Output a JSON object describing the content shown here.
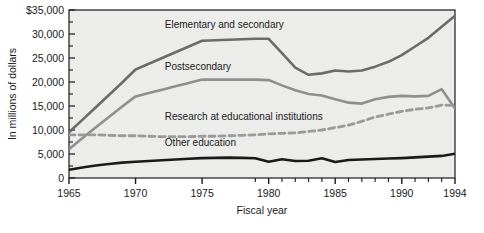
{
  "chart_data": {
    "type": "line",
    "title": "",
    "xlabel": "Fiscal year",
    "ylabel": "In millions of dollars",
    "xlim": [
      1965,
      1994
    ],
    "ylim": [
      0,
      35000
    ],
    "grid": false,
    "legend_position": "inline-labels",
    "background": "#ececea",
    "x_major_ticks": [
      1965,
      1970,
      1975,
      1980,
      1985,
      1990,
      1994
    ],
    "x_tick_labels": [
      "1965",
      "1970",
      "1975",
      "1980",
      "1985",
      "1990",
      "1994"
    ],
    "x_minor_ticks": [
      1966,
      1967,
      1968,
      1969,
      1971,
      1972,
      1973,
      1974,
      1976,
      1977,
      1978,
      1979,
      1981,
      1982,
      1983,
      1984,
      1986,
      1987,
      1988,
      1989,
      1991,
      1992,
      1993
    ],
    "y_ticks": [
      0,
      5000,
      10000,
      15000,
      20000,
      25000,
      30000,
      35000
    ],
    "y_tick_labels": [
      "0",
      "5,000",
      "10,000",
      "15,000",
      "20,000",
      "25,000",
      "30,000",
      "$35,000"
    ],
    "x": [
      1965,
      1966,
      1967,
      1968,
      1969,
      1970,
      1971,
      1972,
      1973,
      1974,
      1975,
      1976,
      1977,
      1978,
      1979,
      1980,
      1981,
      1982,
      1983,
      1984,
      1985,
      1986,
      1987,
      1988,
      1989,
      1990,
      1991,
      1992,
      1993,
      1994
    ],
    "series": [
      {
        "name": "Elementary and secondary",
        "label": "Elementary and secondary",
        "color": "#6b6b6b",
        "style": "solid",
        "width": 2.6,
        "values": [
          9500,
          12100,
          14700,
          17300,
          19900,
          22600,
          23800,
          25000,
          26200,
          27400,
          28600,
          28700,
          28800,
          28900,
          29000,
          29000,
          26000,
          23000,
          21500,
          21800,
          22400,
          22200,
          22400,
          23200,
          24200,
          25600,
          27400,
          29200,
          31500,
          33800
        ]
      },
      {
        "name": "Postsecondary",
        "label": "Postsecondary",
        "color": "#8f8f8f",
        "style": "solid",
        "width": 2.6,
        "values": [
          6000,
          8300,
          10500,
          12700,
          14900,
          17000,
          17700,
          18400,
          19100,
          19800,
          20500,
          20500,
          20500,
          20500,
          20500,
          20400,
          19300,
          18300,
          17500,
          17200,
          16400,
          15700,
          15500,
          16400,
          16900,
          17100,
          17000,
          17100,
          18500,
          14500
        ]
      },
      {
        "name": "Research at educational institutions",
        "label": "Research at educational institutions",
        "color": "#9a9a9a",
        "style": "dashed",
        "width": 2.8,
        "values": [
          9000,
          9000,
          9000,
          8900,
          8800,
          8800,
          8700,
          8600,
          8600,
          8600,
          8700,
          8700,
          8800,
          8900,
          9000,
          9200,
          9300,
          9400,
          9700,
          10000,
          10500,
          11000,
          11800,
          12700,
          13300,
          13900,
          14300,
          14600,
          15200,
          15100
        ]
      },
      {
        "name": "Other education",
        "label": "Other education",
        "color": "#1a1a1a",
        "style": "solid",
        "width": 2.6,
        "values": [
          1700,
          2200,
          2600,
          2900,
          3200,
          3400,
          3550,
          3700,
          3850,
          4000,
          4150,
          4200,
          4250,
          4200,
          4100,
          3400,
          3900,
          3550,
          3600,
          4100,
          3350,
          3750,
          3850,
          3950,
          4050,
          4150,
          4300,
          4450,
          4600,
          5050
        ]
      }
    ],
    "annotations": [
      {
        "text": "Elementary and secondary",
        "x": 1972.2,
        "y": 31200
      },
      {
        "text": "Postsecondary",
        "x": 1972.2,
        "y": 22600
      },
      {
        "text": "Research at educational institutions",
        "x": 1972.2,
        "y": 12000
      },
      {
        "text": "Other education",
        "x": 1972.2,
        "y": 6600
      }
    ]
  }
}
